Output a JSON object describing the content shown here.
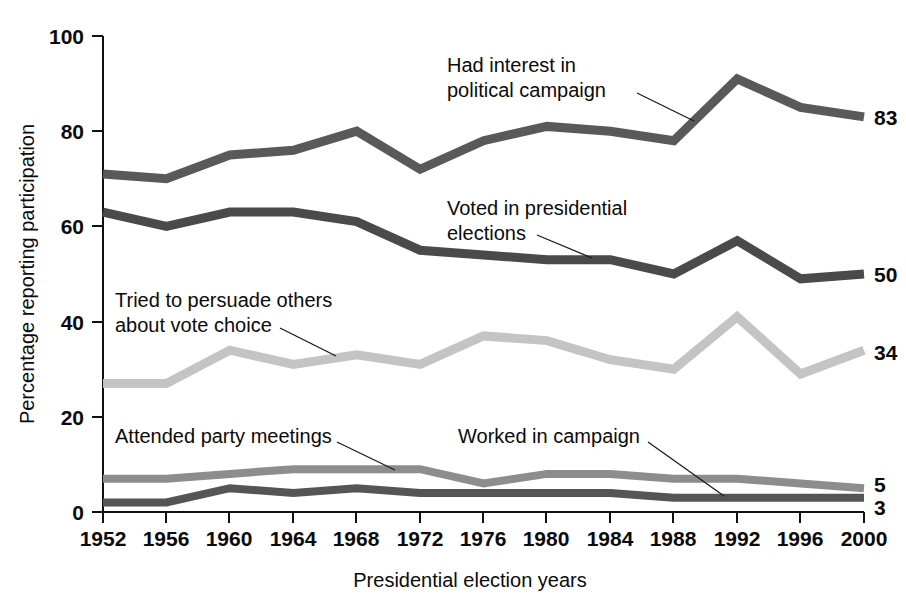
{
  "chart_data": {
    "type": "line",
    "title": "",
    "xlabel": "Presidential election years",
    "ylabel": "Percentage reporting participation",
    "categories": [
      1952,
      1956,
      1960,
      1964,
      1968,
      1972,
      1976,
      1980,
      1984,
      1988,
      1992,
      1996,
      2000
    ],
    "x_tick_labels": [
      "1952",
      "1956",
      "1960",
      "1964",
      "1968",
      "1972",
      "1976",
      "1980",
      "1984",
      "1988",
      "1992",
      "1996",
      "2000"
    ],
    "y_tick_labels": [
      "0",
      "20",
      "40",
      "60",
      "80",
      "100"
    ],
    "y_ticks": [
      0,
      20,
      40,
      60,
      80,
      100
    ],
    "ylim": [
      0,
      100
    ],
    "xlim": [
      1952,
      2000
    ],
    "grid": false,
    "legend_position": "inline-annotations",
    "series": [
      {
        "name": "Had interest in political campaign",
        "color": "#595959",
        "end_value": "83",
        "values": [
          71,
          70,
          75,
          76,
          80,
          72,
          78,
          81,
          80,
          78,
          91,
          85,
          83
        ]
      },
      {
        "name": "Voted in presidential elections",
        "color": "#4a4a4a",
        "end_value": "50",
        "values": [
          63,
          60,
          63,
          63,
          61,
          55,
          54,
          53,
          53,
          50,
          57,
          49,
          50
        ]
      },
      {
        "name": "Tried to persuade others about vote choice",
        "color": "#c4c4c4",
        "end_value": "34",
        "values": [
          27,
          27,
          34,
          31,
          33,
          31,
          37,
          36,
          32,
          30,
          41,
          29,
          34
        ]
      },
      {
        "name": "Attended party meetings",
        "color": "#8d8d8d",
        "end_value": "5",
        "values": [
          7,
          7,
          8,
          9,
          9,
          9,
          6,
          8,
          8,
          7,
          7,
          6,
          5
        ]
      },
      {
        "name": "Worked in campaign",
        "color": "#555555",
        "end_value": "3",
        "values": [
          2,
          2,
          5,
          4,
          5,
          4,
          4,
          4,
          4,
          3,
          3,
          3,
          3
        ]
      }
    ],
    "annotations": [
      {
        "name": "had-interest-label",
        "line1": "Had interest in",
        "line2": "political campaign"
      },
      {
        "name": "voted-label",
        "line1": "Voted in presidential",
        "line2": "elections"
      },
      {
        "name": "persuade-label",
        "line1": "Tried to persuade others",
        "line2": "about vote choice"
      },
      {
        "name": "attended-label",
        "line1": "Attended party meetings",
        "line2": ""
      },
      {
        "name": "worked-label",
        "line1": "Worked in campaign",
        "line2": ""
      }
    ]
  }
}
